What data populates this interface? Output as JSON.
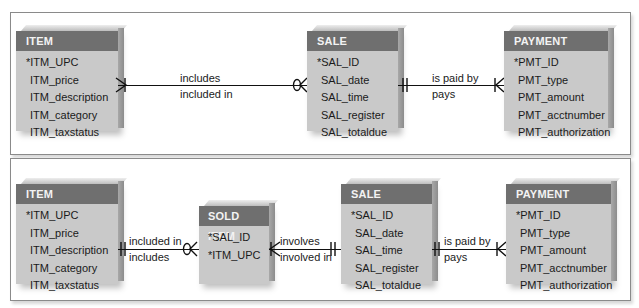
{
  "top_diagram": {
    "entities": {
      "item": {
        "title": "ITEM",
        "attrs": [
          "*ITM_UPC",
          "ITM_price",
          "ITM_description",
          "ITM_category",
          "ITM_taxstatus"
        ]
      },
      "sale": {
        "title": "SALE",
        "attrs": [
          "*SAL_ID",
          "SAL_date",
          "SAL_time",
          "SAL_register",
          "SAL_totaldue"
        ]
      },
      "payment": {
        "title": "PAYMENT",
        "attrs": [
          "*PMT_ID",
          "PMT_type",
          "PMT_amount",
          "PMT_acctnumber",
          "PMT_authorization"
        ]
      }
    },
    "relationships": {
      "item_sale": {
        "upper": "includes",
        "lower": "included in"
      },
      "sale_payment": {
        "upper": "is paid by",
        "lower": "pays"
      }
    }
  },
  "bottom_diagram": {
    "entities": {
      "item": {
        "title": "ITEM",
        "attrs": [
          "*ITM_UPC",
          "ITM_price",
          "ITM_description",
          "ITM_category",
          "ITM_taxstatus"
        ]
      },
      "sold_item": {
        "title": "SOLD ITEM",
        "attrs": [
          "*SAL_ID",
          "*ITM_UPC"
        ]
      },
      "sale": {
        "title": "SALE",
        "attrs": [
          "*SAL_ID",
          "SAL_date",
          "SAL_time",
          "SAL_register",
          "SAL_totaldue"
        ]
      },
      "payment": {
        "title": "PAYMENT",
        "attrs": [
          "*PMT_ID",
          "PMT_type",
          "PMT_amount",
          "PMT_acctnumber",
          "PMT_authorization"
        ]
      }
    },
    "relationships": {
      "item_solditem": {
        "upper": "included in",
        "lower": "includes"
      },
      "solditem_sale": {
        "upper": "involves",
        "lower": "involved in"
      },
      "sale_payment": {
        "upper": "is paid by",
        "lower": "pays"
      }
    }
  },
  "colors": {
    "header": "#6f6f6f",
    "body": "#c9c9c9",
    "line": "#111111",
    "frame": "#8a8a8a"
  }
}
